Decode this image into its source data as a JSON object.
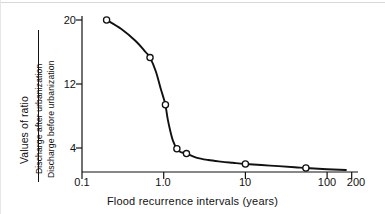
{
  "chart_data": {
    "type": "line",
    "title": "",
    "xlabel": "Flood recurrence intervals (years)",
    "ylabel": "Values of ratio",
    "ylabel_numerator": "Discharge after urbanization",
    "ylabel_denominator": "Discharge before urbanization",
    "xscale": "log",
    "yscale": "linear",
    "xlim": [
      0.1,
      200
    ],
    "ylim": [
      1.1,
      20.6
    ],
    "grid": false,
    "legend": false,
    "xticks": [
      {
        "value": 0.1,
        "label": "0.1"
      },
      {
        "value": 1.0,
        "label": "1.0"
      },
      {
        "value": 10,
        "label": "10"
      },
      {
        "value": 100,
        "label": "100"
      },
      {
        "value": 200,
        "label": "200"
      }
    ],
    "yticks": [
      {
        "value": 20,
        "label": "20"
      },
      {
        "value": 12,
        "label": "12"
      },
      {
        "value": 4,
        "label": "4"
      }
    ],
    "series": [
      {
        "name": "Ratio of discharge after to before urbanization",
        "marker": "open-circle",
        "x": [
          0.2,
          0.68,
          1.05,
          1.45,
          1.9,
          10,
          55
        ],
        "y": [
          20.0,
          15.3,
          9.4,
          3.9,
          3.3,
          2.0,
          1.5
        ]
      }
    ],
    "curve_x": [
      0.2,
      0.3,
      0.45,
      0.6,
      0.68,
      0.8,
      0.92,
      1.0,
      1.05,
      1.12,
      1.2,
      1.3,
      1.45,
      1.6,
      1.9,
      2.5,
      3.5,
      5,
      7,
      10,
      20,
      40,
      55,
      100,
      170
    ],
    "curve_y": [
      20.0,
      18.9,
      17.4,
      16.0,
      15.3,
      13.6,
      11.4,
      10.2,
      9.4,
      7.6,
      6.2,
      4.9,
      3.9,
      3.5,
      3.3,
      2.8,
      2.5,
      2.3,
      2.15,
      2.0,
      1.8,
      1.6,
      1.5,
      1.35,
      1.25
    ]
  },
  "axes": {
    "left_rule_label": "y-axis",
    "bottom_rule_label": "x-axis"
  }
}
